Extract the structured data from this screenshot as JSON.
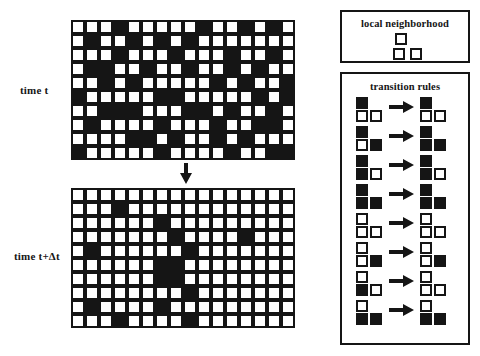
{
  "figure": {
    "ink_color": "#151515",
    "background": "#ffffff"
  },
  "labels": {
    "time_t": "time t",
    "time_t_delta": "time t+Δt"
  },
  "panels": {
    "neighborhood": {
      "title": "local neighborhood",
      "cells": [
        {
          "position": "top",
          "state": "white"
        },
        {
          "position": "bottom-left",
          "state": "white"
        },
        {
          "position": "bottom-right",
          "state": "white"
        }
      ]
    },
    "rules": {
      "title": "transition rules",
      "arrow_glyph": "right-arrow",
      "items": [
        {
          "index": 1,
          "lhs": {
            "top": "black",
            "bl": "white",
            "br": "white"
          },
          "rhs": {
            "top": "black",
            "bl": "white",
            "br": "white"
          }
        },
        {
          "index": 2,
          "lhs": {
            "top": "black",
            "bl": "white",
            "br": "black"
          },
          "rhs": {
            "top": "black",
            "bl": "black",
            "br": "black"
          }
        },
        {
          "index": 3,
          "lhs": {
            "top": "black",
            "bl": "black",
            "br": "white"
          },
          "rhs": {
            "top": "black",
            "bl": "black",
            "br": "white"
          }
        },
        {
          "index": 4,
          "lhs": {
            "top": "black",
            "bl": "black",
            "br": "black"
          },
          "rhs": {
            "top": "black",
            "bl": "black",
            "br": "black"
          }
        },
        {
          "index": 5,
          "lhs": {
            "top": "white",
            "bl": "white",
            "br": "white"
          },
          "rhs": {
            "top": "white",
            "bl": "white",
            "br": "white"
          }
        },
        {
          "index": 6,
          "lhs": {
            "top": "white",
            "bl": "white",
            "br": "black"
          },
          "rhs": {
            "top": "white",
            "bl": "white",
            "br": "black"
          }
        },
        {
          "index": 7,
          "lhs": {
            "top": "white",
            "bl": "black",
            "br": "white"
          },
          "rhs": {
            "top": "white",
            "bl": "white",
            "br": "white"
          }
        },
        {
          "index": 8,
          "lhs": {
            "top": "white",
            "bl": "black",
            "br": "black"
          },
          "rhs": {
            "top": "white",
            "bl": "black",
            "br": "black"
          }
        }
      ]
    }
  },
  "flow_arrow": {
    "direction": "down",
    "glyph": "down-arrow"
  },
  "chart_data": {
    "type": "heatmap",
    "xlabel": "",
    "ylabel": "",
    "grid_columns": 16,
    "grid_rows": 10,
    "legend": [
      "white = off",
      "black = on"
    ],
    "grids": [
      {
        "name": "time t",
        "rows": [
          [
            0,
            0,
            0,
            1,
            0,
            0,
            0,
            0,
            0,
            1,
            0,
            0,
            1,
            0,
            1,
            0
          ],
          [
            0,
            1,
            0,
            0,
            1,
            0,
            1,
            0,
            1,
            0,
            0,
            0,
            0,
            0,
            0,
            0
          ],
          [
            0,
            0,
            0,
            1,
            0,
            0,
            0,
            1,
            0,
            0,
            0,
            1,
            0,
            0,
            1,
            0
          ],
          [
            0,
            1,
            1,
            0,
            0,
            1,
            0,
            0,
            1,
            0,
            0,
            1,
            0,
            1,
            0,
            0
          ],
          [
            0,
            0,
            1,
            0,
            1,
            0,
            0,
            0,
            0,
            0,
            1,
            0,
            1,
            0,
            0,
            1
          ],
          [
            1,
            0,
            0,
            0,
            0,
            0,
            1,
            1,
            0,
            0,
            0,
            0,
            0,
            1,
            0,
            1
          ],
          [
            0,
            0,
            1,
            1,
            1,
            0,
            0,
            0,
            1,
            1,
            0,
            1,
            0,
            0,
            1,
            0
          ],
          [
            0,
            1,
            0,
            0,
            0,
            0,
            1,
            0,
            0,
            0,
            1,
            0,
            0,
            1,
            1,
            0
          ],
          [
            0,
            0,
            0,
            0,
            1,
            1,
            0,
            1,
            0,
            0,
            1,
            0,
            1,
            0,
            0,
            0
          ],
          [
            1,
            0,
            0,
            0,
            0,
            0,
            1,
            0,
            0,
            0,
            0,
            1,
            0,
            0,
            1,
            1
          ]
        ]
      },
      {
        "name": "time t+Δt",
        "rows": [
          [
            0,
            0,
            0,
            0,
            0,
            0,
            0,
            0,
            0,
            0,
            0,
            0,
            0,
            0,
            0,
            0
          ],
          [
            0,
            0,
            0,
            1,
            0,
            0,
            0,
            0,
            0,
            0,
            0,
            0,
            0,
            0,
            0,
            0
          ],
          [
            0,
            0,
            0,
            0,
            0,
            0,
            1,
            0,
            0,
            0,
            0,
            0,
            0,
            0,
            0,
            0
          ],
          [
            0,
            0,
            0,
            0,
            0,
            0,
            0,
            1,
            0,
            0,
            0,
            0,
            1,
            0,
            0,
            0
          ],
          [
            0,
            1,
            0,
            0,
            0,
            0,
            0,
            0,
            1,
            0,
            0,
            0,
            0,
            0,
            0,
            0
          ],
          [
            0,
            0,
            0,
            0,
            0,
            0,
            1,
            1,
            0,
            0,
            0,
            0,
            0,
            0,
            0,
            0
          ],
          [
            0,
            0,
            0,
            0,
            0,
            0,
            1,
            1,
            0,
            0,
            0,
            0,
            0,
            0,
            0,
            0
          ],
          [
            0,
            0,
            0,
            0,
            0,
            0,
            0,
            0,
            1,
            0,
            0,
            0,
            0,
            0,
            0,
            0
          ],
          [
            0,
            1,
            0,
            0,
            0,
            0,
            1,
            0,
            0,
            0,
            0,
            0,
            0,
            0,
            0,
            0
          ],
          [
            0,
            0,
            0,
            1,
            0,
            0,
            0,
            0,
            1,
            0,
            0,
            0,
            0,
            0,
            0,
            0
          ]
        ]
      }
    ]
  }
}
